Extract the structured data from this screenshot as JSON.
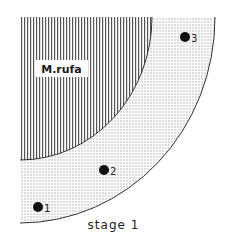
{
  "diagram": {
    "caption": "stage 1",
    "inner_region_label": "M.rufa",
    "points": [
      {
        "label": "1",
        "x": 38,
        "y": 207
      },
      {
        "label": "2",
        "x": 104,
        "y": 170
      },
      {
        "label": "3",
        "x": 185,
        "y": 37
      }
    ],
    "colors": {
      "ink": "#1a1a1a",
      "hatch": "#555555",
      "dots": "#666666",
      "background": "#ffffff"
    }
  }
}
